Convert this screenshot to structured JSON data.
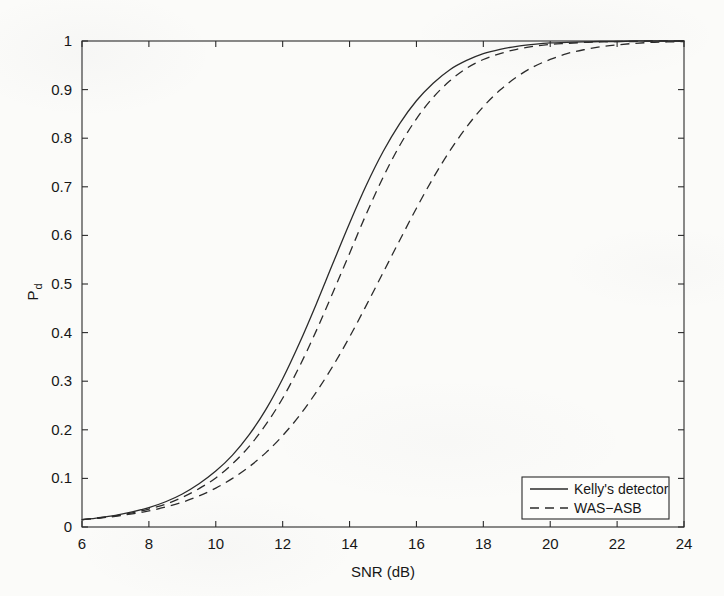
{
  "chart_data": {
    "type": "line",
    "title": "",
    "xlabel": "SNR (dB)",
    "ylabel": "P_d",
    "ylabel_base": "P",
    "ylabel_sub": "d",
    "xlim": [
      6,
      24
    ],
    "ylim": [
      0,
      1
    ],
    "xticks": [
      6,
      8,
      10,
      12,
      14,
      16,
      18,
      20,
      22,
      24
    ],
    "xticklabels": [
      "6",
      "8",
      "10",
      "12",
      "14",
      "16",
      "18",
      "20",
      "22",
      "24"
    ],
    "yticks": [
      0,
      0.1,
      0.2,
      0.3,
      0.4,
      0.5,
      0.6,
      0.7,
      0.8,
      0.9,
      1
    ],
    "yticklabels": [
      "0",
      "0.1",
      "0.2",
      "0.3",
      "0.4",
      "0.5",
      "0.6",
      "0.7",
      "0.8",
      "0.9",
      "1"
    ],
    "grid": false,
    "legend_position": "lower right",
    "x": [
      6,
      6.5,
      7,
      7.5,
      8,
      8.5,
      9,
      9.5,
      10,
      10.5,
      11,
      11.5,
      12,
      12.5,
      13,
      13.5,
      14,
      14.5,
      15,
      15.5,
      16,
      16.5,
      17,
      17.5,
      18,
      18.5,
      19,
      19.5,
      20,
      20.5,
      21,
      21.5,
      22,
      22.5,
      23,
      23.5,
      24
    ],
    "series": [
      {
        "name": "Kelly's detector",
        "style": "solid",
        "color": "#2b2b2b",
        "values": [
          0.015,
          0.019,
          0.024,
          0.031,
          0.04,
          0.052,
          0.068,
          0.089,
          0.115,
          0.148,
          0.19,
          0.242,
          0.305,
          0.378,
          0.458,
          0.542,
          0.625,
          0.703,
          0.772,
          0.83,
          0.877,
          0.913,
          0.941,
          0.96,
          0.974,
          0.983,
          0.989,
          0.993,
          0.996,
          0.997,
          0.998,
          0.999,
          0.999,
          1.0,
          1.0,
          1.0,
          1.0
        ]
      },
      {
        "name": "WAS-ASB",
        "style": "dashed",
        "color": "#2b2b2b",
        "values": [
          0.015,
          0.019,
          0.023,
          0.029,
          0.037,
          0.047,
          0.061,
          0.079,
          0.101,
          0.13,
          0.166,
          0.211,
          0.265,
          0.33,
          0.403,
          0.482,
          0.563,
          0.644,
          0.719,
          0.785,
          0.84,
          0.884,
          0.918,
          0.944,
          0.962,
          0.974,
          0.983,
          0.989,
          0.993,
          0.995,
          0.997,
          0.998,
          0.999,
          0.999,
          1.0,
          1.0,
          1.0
        ]
      },
      {
        "name": "WAS-ASB",
        "style": "dashed",
        "color": "#2b2b2b",
        "values": [
          0.015,
          0.018,
          0.022,
          0.027,
          0.033,
          0.041,
          0.051,
          0.064,
          0.08,
          0.1,
          0.124,
          0.153,
          0.188,
          0.229,
          0.277,
          0.331,
          0.391,
          0.456,
          0.523,
          0.59,
          0.656,
          0.718,
          0.774,
          0.823,
          0.865,
          0.899,
          0.926,
          0.947,
          0.962,
          0.974,
          0.982,
          0.988,
          0.992,
          0.995,
          0.997,
          0.998,
          0.999
        ]
      }
    ],
    "legend_entries": [
      {
        "label": "Kelly's detector",
        "style": "solid"
      },
      {
        "label": "WAS−ASB",
        "style": "dashed"
      }
    ]
  }
}
